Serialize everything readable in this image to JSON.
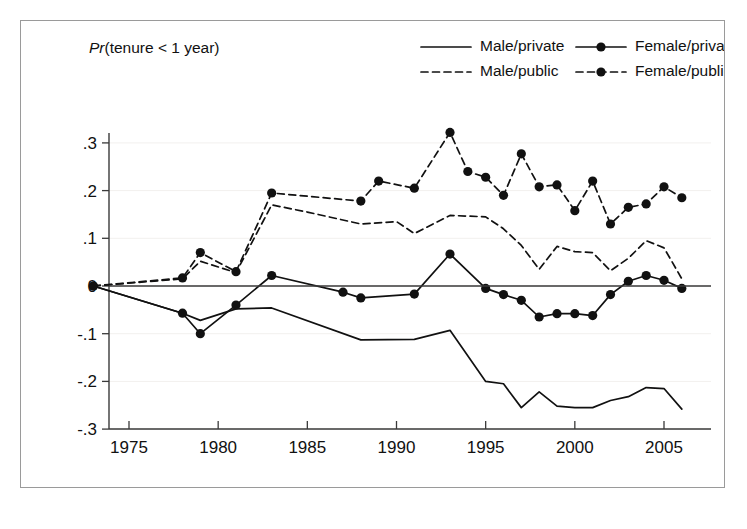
{
  "figure": {
    "title": "Pr(tenure < 1 year)",
    "title_italic_part": "Pr",
    "title_rest": "(tenure < 1 year)",
    "frame_color": "#9a9a9a",
    "background": "#ffffff",
    "ink_color": "#111111"
  },
  "legend": {
    "position": "top-right",
    "entries": [
      {
        "label": "Male/private",
        "style": "solid",
        "marker": "none",
        "row": 0,
        "col": 0
      },
      {
        "label": "Female/private",
        "style": "solid",
        "marker": "circle",
        "row": 0,
        "col": 1
      },
      {
        "label": "Male/public",
        "style": "dashed",
        "marker": "none",
        "row": 1,
        "col": 0
      },
      {
        "label": "Female/public",
        "style": "dashed",
        "marker": "circle",
        "row": 1,
        "col": 1
      }
    ]
  },
  "chart_data": {
    "type": "line",
    "title": "Pr(tenure < 1 year)",
    "xlabel": "",
    "ylabel": "",
    "xlim": [
      1973,
      2006
    ],
    "ylim": [
      -0.3,
      0.35
    ],
    "xticks": [
      1975,
      1980,
      1985,
      1990,
      1995,
      2000,
      2005
    ],
    "xtick_labels": [
      "1975",
      "1980",
      "1985",
      "1990",
      "1995",
      "2000",
      "2005"
    ],
    "yticks": [
      0.3,
      0.2,
      0.1,
      0.0,
      -0.1,
      -0.2,
      -0.3
    ],
    "ytick_labels": [
      ".3",
      ".2",
      ".1",
      "0",
      "-.1",
      "-.2",
      "-.3"
    ],
    "grid": "faint-horizontal",
    "zero_reference_line": true,
    "series": [
      {
        "name": "Male/private",
        "style": "solid",
        "marker": "none",
        "x": [
          1973,
          1978,
          1979,
          1981,
          1983,
          1988,
          1991,
          1993,
          1995,
          1996,
          1997,
          1998,
          1999,
          2000,
          2001,
          2002,
          2003,
          2004,
          2005,
          2006
        ],
        "y": [
          0.0,
          -0.057,
          -0.072,
          -0.048,
          -0.046,
          -0.113,
          -0.112,
          -0.093,
          -0.2,
          -0.205,
          -0.255,
          -0.222,
          -0.252,
          -0.255,
          -0.255,
          -0.24,
          -0.232,
          -0.213,
          -0.215,
          -0.258
        ]
      },
      {
        "name": "Female/private",
        "style": "solid",
        "marker": "circle",
        "x": [
          1973,
          1978,
          1979,
          1981,
          1983,
          1987,
          1988,
          1991,
          1993,
          1995,
          1996,
          1997,
          1998,
          1999,
          2000,
          2001,
          2002,
          2003,
          2004,
          2005,
          2006
        ],
        "y": [
          0.0,
          -0.057,
          -0.1,
          -0.04,
          0.022,
          -0.013,
          -0.025,
          -0.017,
          0.067,
          -0.005,
          -0.018,
          -0.03,
          -0.065,
          -0.058,
          -0.058,
          -0.062,
          -0.018,
          0.01,
          0.022,
          0.012,
          -0.005
        ]
      },
      {
        "name": "Male/public",
        "style": "dashed",
        "marker": "none",
        "x": [
          1973,
          1978,
          1979,
          1981,
          1983,
          1985,
          1988,
          1990,
          1991,
          1993,
          1995,
          1996,
          1997,
          1998,
          1999,
          2000,
          2001,
          2002,
          2003,
          2004,
          2005,
          2006
        ],
        "y": [
          0.0,
          0.015,
          0.052,
          0.028,
          0.17,
          0.155,
          0.13,
          0.135,
          0.11,
          0.148,
          0.145,
          0.12,
          0.085,
          0.035,
          0.083,
          0.072,
          0.07,
          0.032,
          0.058,
          0.095,
          0.08,
          0.015
        ]
      },
      {
        "name": "Female/public",
        "style": "dashed",
        "marker": "circle",
        "x": [
          1973,
          1978,
          1979,
          1981,
          1983,
          1988,
          1989,
          1991,
          1993,
          1994,
          1995,
          1996,
          1997,
          1998,
          1999,
          2000,
          2001,
          2002,
          2003,
          2004,
          2005,
          2006
        ],
        "y": [
          0.0,
          0.017,
          0.07,
          0.03,
          0.195,
          0.178,
          0.22,
          0.205,
          0.322,
          0.24,
          0.228,
          0.19,
          0.277,
          0.208,
          0.212,
          0.158,
          0.22,
          0.13,
          0.165,
          0.172,
          0.208,
          0.185
        ]
      }
    ]
  }
}
